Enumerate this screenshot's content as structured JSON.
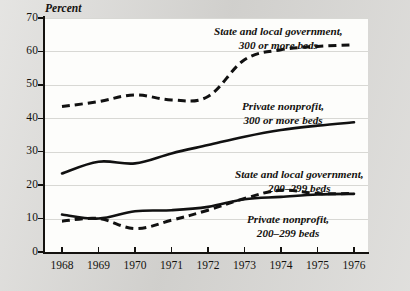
{
  "chart_data": {
    "type": "line",
    "title": "",
    "subtitle": "",
    "ylabel": "Percent",
    "xlabel": "",
    "ylim": [
      0,
      70
    ],
    "xlim": [
      1968,
      1976
    ],
    "grid": true,
    "legend_position": "inline-annotations",
    "x": [
      1968,
      1969,
      1970,
      1971,
      1972,
      1973,
      1974,
      1975,
      1976
    ],
    "x_tick_labels": [
      "1968",
      "1969",
      "1970",
      "1971",
      "1972",
      "1973",
      "1974",
      "1975",
      "1976"
    ],
    "y_tick_labels": [
      "0",
      "10",
      "20",
      "30",
      "40",
      "50",
      "60",
      "70"
    ],
    "y_ticks": [
      0,
      10,
      20,
      30,
      40,
      50,
      60,
      70
    ],
    "series": [
      {
        "name": "State and local government, 300 or more beds",
        "style": "dashed",
        "label_line1": "State and local government,",
        "label_line2": "300 or more beds",
        "values": [
          43.5,
          45.0,
          47.0,
          45.5,
          46.5,
          57.5,
          60.5,
          61.5,
          62.0
        ]
      },
      {
        "name": "Private nonprofit, 300 or more beds",
        "style": "solid",
        "label_line1": "Private nonprofit,",
        "label_line2": "300 or more beds",
        "values": [
          23.5,
          27.0,
          26.5,
          29.5,
          32.0,
          34.5,
          36.5,
          37.8,
          38.8
        ]
      },
      {
        "name": "State and local government, 200-299 beds",
        "style": "dashed",
        "label_line1": "State and local government,",
        "label_line2": "200–299 beds",
        "values": [
          9.2,
          10.0,
          7.0,
          9.5,
          12.5,
          16.0,
          18.5,
          17.5,
          17.5
        ]
      },
      {
        "name": "Private nonprofit, 200-299 beds",
        "style": "solid",
        "label_line1": "Private nonprofit,",
        "label_line2": "200–299 beds",
        "values": [
          11.2,
          10.0,
          12.2,
          12.5,
          13.5,
          15.8,
          16.5,
          17.2,
          17.4
        ]
      }
    ],
    "colors": {
      "line": "#111111",
      "plot_background": "#fdfdfb",
      "page_background": "#d7d6d3",
      "gridline": "#d8d8d4",
      "axis": "#14120f"
    }
  }
}
